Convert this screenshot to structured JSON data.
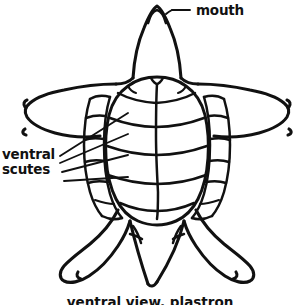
{
  "figure": {
    "title": "ventral view, plastron",
    "style": "hand-drawn ink line diagram",
    "background_color": "#ffffff",
    "ink_color": "#111111"
  },
  "labels": {
    "mouth": "mouth",
    "ventral_scutes_line1": "ventral",
    "ventral_scutes_line2": "scutes"
  },
  "caption": {
    "text": "ventral view, plastron"
  },
  "anatomy": {
    "parts": [
      "head",
      "mouth",
      "left front flipper",
      "right front flipper",
      "plastron",
      "ventral scutes",
      "left rear flipper",
      "right rear flipper",
      "tail"
    ],
    "mouth_label_leader": "dash",
    "ventral_scutes_leader_count": 4
  }
}
